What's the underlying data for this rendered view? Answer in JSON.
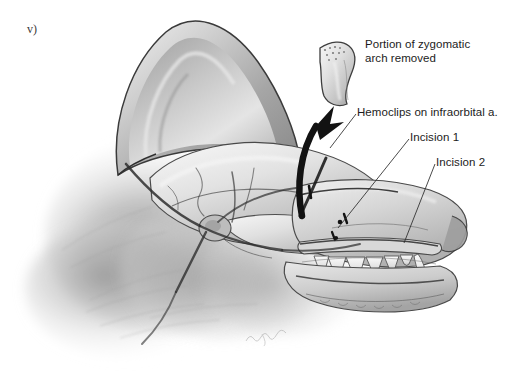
{
  "figure": {
    "marker": "v)",
    "background_color": "#ffffff",
    "ink_color": "#1c1c1c",
    "medium": "grayscale pencil / airbrush medical illustration",
    "artist_signature": "artist signature (cursive, faint)"
  },
  "labels": [
    {
      "id": "zygomatic",
      "text": "Portion of zygomatic\narch removed",
      "lines": [
        "Portion of zygomatic",
        "arch removed"
      ],
      "has_leader_line": false
    },
    {
      "id": "hemoclips",
      "text": "Hemoclips on infraorbital a.",
      "lines": [
        "Hemoclips on infraorbital a."
      ],
      "has_leader_line": true
    },
    {
      "id": "incision1",
      "text": "Incision 1",
      "lines": [
        "Incision 1"
      ],
      "has_leader_line": true
    },
    {
      "id": "incision2",
      "text": "Incision 2",
      "lines": [
        "Incision 2"
      ],
      "has_leader_line": true
    }
  ],
  "anatomy": {
    "parts": [
      "pinna (erect pointed ear)",
      "cranium / frontal bone",
      "temporal region",
      "zygomatic arch (sectioned)",
      "temporomandibular joint",
      "maxilla",
      "mandible",
      "maxillary dentition (canine and premolars)",
      "nasal planum / muzzle",
      "neck ruff fur"
    ],
    "vessels": "infraorbital artery and superficial temporal branches drawn as dark lines",
    "removed_fragment": "excised curved segment of zygomatic arch with stippled cut ends",
    "arrow": "thick black curved arrow showing fragment lifted dorsally and rostrally"
  }
}
